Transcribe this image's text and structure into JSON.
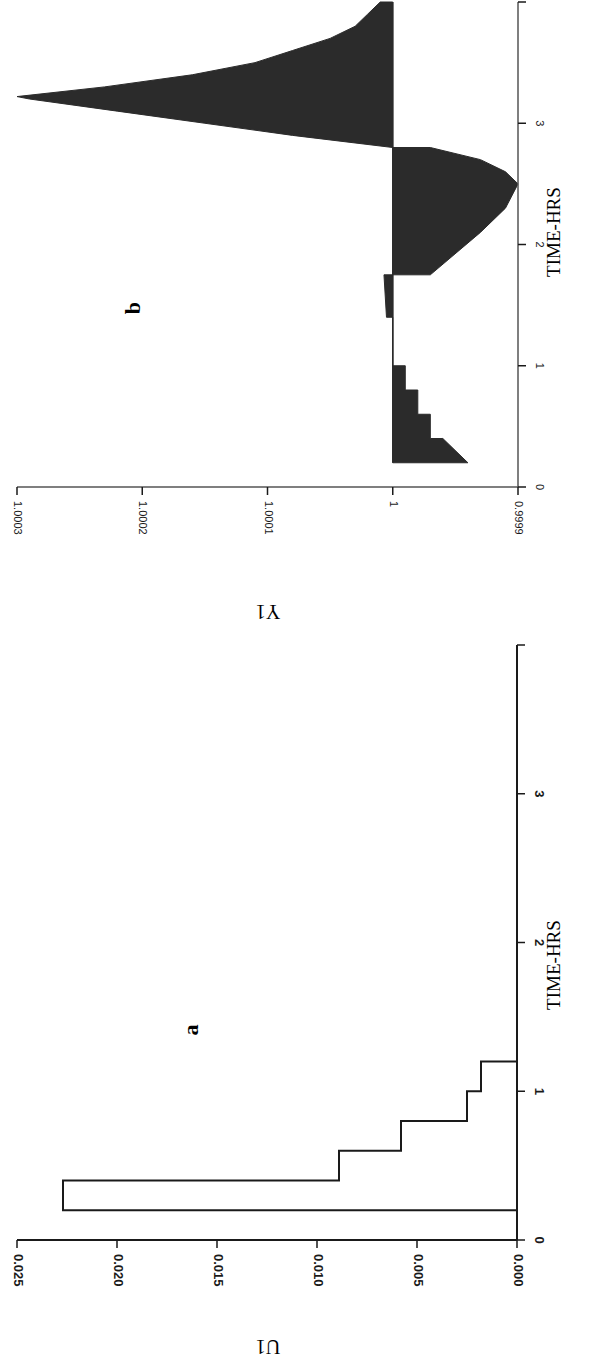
{
  "figure": {
    "orientation": "rotated-90-ccw",
    "ink_color": "#1a1a1a",
    "fill_color": "#2b2b2b",
    "background": "#ffffff"
  },
  "chart_data": [
    {
      "panel": "a",
      "type": "bar",
      "style": "step-histogram-outline",
      "title": "",
      "panel_label": "a",
      "xlabel": "TIME-HRS",
      "ylabel": "U1",
      "xlim": [
        0,
        4
      ],
      "ylim": [
        0,
        0.025
      ],
      "x_ticks": [
        "0",
        "1",
        "2",
        "3",
        ""
      ],
      "y_ticks": [
        "0.000",
        "0.005",
        "0.010",
        "0.015",
        "0.020",
        "0.025"
      ],
      "bins": [
        {
          "x0": 0.2,
          "x1": 0.4,
          "value": 0.0227
        },
        {
          "x0": 0.4,
          "x1": 0.6,
          "value": 0.0089
        },
        {
          "x0": 0.6,
          "x1": 0.8,
          "value": 0.0058
        },
        {
          "x0": 0.8,
          "x1": 1.0,
          "value": 0.0025
        },
        {
          "x0": 1.0,
          "x1": 1.2,
          "value": 0.0018
        }
      ],
      "grid": false
    },
    {
      "panel": "b",
      "type": "area",
      "style": "filled-relative-to-baseline-1",
      "title": "",
      "panel_label": "b",
      "xlabel": "TIME-HRS",
      "ylabel": "Y1",
      "xlim": [
        0,
        4
      ],
      "ylim": [
        0.9999,
        1.0003
      ],
      "baseline": 1.0,
      "x_ticks": [
        "0",
        "1",
        "2",
        "3",
        ""
      ],
      "y_ticks": [
        "0.9999",
        "1",
        "1.0001",
        "1.0002",
        "1.0003"
      ],
      "x": [
        0.2,
        0.2,
        0.4,
        0.4,
        0.6,
        0.6,
        0.8,
        0.8,
        1.0,
        1.0,
        1.4,
        1.4,
        1.75,
        1.75,
        2.1,
        2.3,
        2.5,
        2.6,
        2.7,
        2.8,
        2.8,
        2.9,
        3.0,
        3.1,
        3.2,
        3.22,
        3.3,
        3.4,
        3.5,
        3.6,
        3.7,
        3.8,
        3.9,
        4.0
      ],
      "y": [
        1.0,
        0.99994,
        0.99996,
        0.99997,
        0.99997,
        0.99998,
        0.99998,
        0.99999,
        0.99999,
        1.0,
        1.0,
        1.000005,
        1.000007,
        0.99997,
        0.99993,
        0.99991,
        0.9999,
        0.99991,
        0.99993,
        0.99997,
        1.0,
        1.00008,
        1.00015,
        1.00022,
        1.00029,
        1.0003,
        1.00023,
        1.00016,
        1.00011,
        1.00008,
        1.00005,
        1.00003,
        1.00002,
        1.00001
      ],
      "grid": false
    }
  ]
}
